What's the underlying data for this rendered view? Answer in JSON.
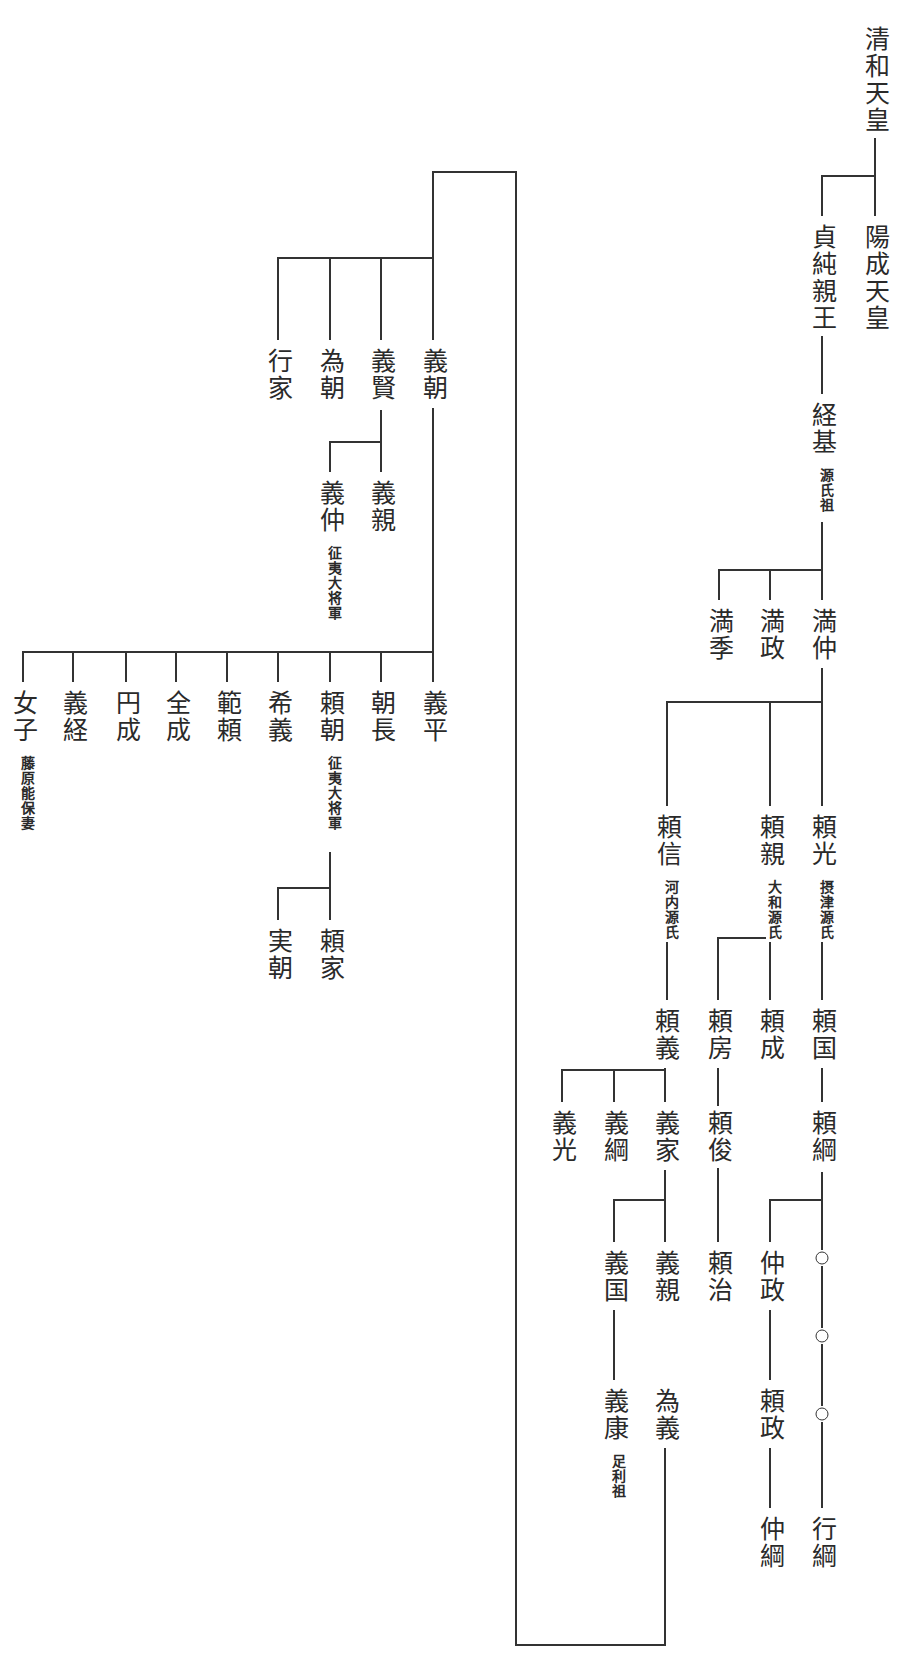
{
  "diagram": {
    "type": "genealogy-tree",
    "line_color": "#333333",
    "text_color": "#2a2a2a"
  },
  "nodes": [
    {
      "id": "seiwa",
      "name": "清和天皇",
      "x": 875,
      "y": 22
    },
    {
      "id": "yozei",
      "name": "陽成天皇",
      "x": 875,
      "y": 220
    },
    {
      "id": "sadazumi",
      "name": "貞純親王",
      "x": 822,
      "y": 220
    },
    {
      "id": "tsunemoto",
      "name": "経基",
      "x": 822,
      "y": 398,
      "note": "源氏祖"
    },
    {
      "id": "mitsunaka",
      "name": "満仲",
      "x": 822,
      "y": 604
    },
    {
      "id": "mitsumasa",
      "name": "満政",
      "x": 770,
      "y": 604
    },
    {
      "id": "mitsusue",
      "name": "満季",
      "x": 719,
      "y": 604
    },
    {
      "id": "yorimitsu",
      "name": "頼光",
      "x": 822,
      "y": 810,
      "note": "摂津源氏"
    },
    {
      "id": "yorichika",
      "name": "頼親",
      "x": 770,
      "y": 810,
      "note": "大和源氏"
    },
    {
      "id": "yorinobu",
      "name": "頼信",
      "x": 667,
      "y": 810,
      "note": "河内源氏"
    },
    {
      "id": "yorikuni",
      "name": "頼国",
      "x": 822,
      "y": 1004
    },
    {
      "id": "yorinari",
      "name": "頼成",
      "x": 770,
      "y": 1004
    },
    {
      "id": "yorifusa",
      "name": "頼房",
      "x": 718,
      "y": 1004
    },
    {
      "id": "yoriyoshi",
      "name": "頼義",
      "x": 665,
      "y": 1004
    },
    {
      "id": "yoritsuna",
      "name": "頼綱",
      "x": 822,
      "y": 1106
    },
    {
      "id": "yoritoshi",
      "name": "頼俊",
      "x": 718,
      "y": 1106
    },
    {
      "id": "yoshiie",
      "name": "義家",
      "x": 665,
      "y": 1106
    },
    {
      "id": "yoshitsuna",
      "name": "義綱",
      "x": 614,
      "y": 1106
    },
    {
      "id": "yoshimitsu",
      "name": "義光",
      "x": 562,
      "y": 1106
    },
    {
      "id": "nakamasa",
      "name": "仲政",
      "x": 770,
      "y": 1246
    },
    {
      "id": "yoriharu",
      "name": "頼治",
      "x": 718,
      "y": 1246
    },
    {
      "id": "yoshichika",
      "name": "義親",
      "x": 665,
      "y": 1246
    },
    {
      "id": "yoshikuni",
      "name": "義国",
      "x": 614,
      "y": 1246
    },
    {
      "id": "yorimasa",
      "name": "頼政",
      "x": 770,
      "y": 1384
    },
    {
      "id": "tameyoshi",
      "name": "為義",
      "x": 665,
      "y": 1384
    },
    {
      "id": "yoshiyasu",
      "name": "義康",
      "x": 614,
      "y": 1384,
      "note": "足利祖"
    },
    {
      "id": "nakatsuna",
      "name": "仲綱",
      "x": 770,
      "y": 1512
    },
    {
      "id": "yukitsuna",
      "name": "行綱",
      "x": 822,
      "y": 1512
    },
    {
      "id": "yoshitomo",
      "name": "義朝",
      "x": 433,
      "y": 344
    },
    {
      "id": "yoshikata",
      "name": "義賢",
      "x": 381,
      "y": 344
    },
    {
      "id": "tametomo",
      "name": "為朝",
      "x": 330,
      "y": 344
    },
    {
      "id": "yukiie",
      "name": "行家",
      "x": 278,
      "y": 344
    },
    {
      "id": "yoshichika2",
      "name": "義親",
      "x": 381,
      "y": 476
    },
    {
      "id": "yoshinaka",
      "name": "義仲",
      "x": 330,
      "y": 476,
      "note": "征夷大将軍"
    },
    {
      "id": "yoshihira",
      "name": "義平",
      "x": 433,
      "y": 686
    },
    {
      "id": "tomonaga",
      "name": "朝長",
      "x": 381,
      "y": 686
    },
    {
      "id": "yoritomo",
      "name": "頼朝",
      "x": 330,
      "y": 686,
      "note": "征夷大将軍"
    },
    {
      "id": "mareyoshi",
      "name": "希義",
      "x": 278,
      "y": 686
    },
    {
      "id": "noriyori",
      "name": "範頼",
      "x": 227,
      "y": 686
    },
    {
      "id": "zenjo",
      "name": "全成",
      "x": 176,
      "y": 686
    },
    {
      "id": "enjo",
      "name": "円成",
      "x": 126,
      "y": 686
    },
    {
      "id": "yoshitsune",
      "name": "義経",
      "x": 73,
      "y": 686
    },
    {
      "id": "nyoshi",
      "name": "女子",
      "x": 23,
      "y": 686,
      "note": "藤原能保妻"
    },
    {
      "id": "yoriie",
      "name": "頼家",
      "x": 330,
      "y": 924
    },
    {
      "id": "sanetomo",
      "name": "実朝",
      "x": 278,
      "y": 924
    }
  ],
  "placeholders": [
    {
      "id": "unknown1",
      "symbol": "○",
      "x": 822,
      "y": 1258
    },
    {
      "id": "unknown2",
      "symbol": "○",
      "x": 822,
      "y": 1336
    },
    {
      "id": "unknown3",
      "symbol": "○",
      "x": 822,
      "y": 1414
    }
  ],
  "connectors": [
    "M875 120 L875 216",
    "M875 176 L822 176 L822 216",
    "M822 330 L822 394",
    "M822 522 L822 600",
    "M822 570 L719 570 L719 600",
    "M770 570 L770 600",
    "M822 668 L822 806",
    "M822 702 L667 702 L667 806",
    "M770 702 L770 806",
    "M822 890 L822 1000",
    "M770 890 L770 1000",
    "M770 938 L718 938 L718 1000",
    "M667 890 L667 1000",
    "M822 1068 L822 1102",
    "M665 1068 L665 1102",
    "M665 1070 L562 1070 L562 1102",
    "M614 1070 L614 1102",
    "M718 1068 L718 1242",
    "M822 1172 L822 1250",
    "M822 1200 L770 1200 L770 1242",
    "M665 1170 L665 1242",
    "M665 1200 L614 1200 L614 1242",
    "M822 1266 L822 1328",
    "M822 1344 L822 1406",
    "M822 1422 L822 1508",
    "M770 1310 L770 1380",
    "M770 1448 L770 1508",
    "M614 1310 L614 1380",
    "M665 1448 L665 1645 L516 1645 L516 172 L433 172 L433 340",
    "M433 408 L433 652",
    "M433 258 L278 258 L278 340",
    "M381 258 L381 340",
    "M330 258 L330 340",
    "M381 410 L381 472",
    "M381 442 L330 442 L330 472",
    "M433 652 L23 652 L23 682",
    "M73 652 L73 682",
    "M126 652 L126 682",
    "M176 652 L176 682",
    "M227 652 L227 682",
    "M278 652 L278 682",
    "M330 652 L330 682",
    "M381 652 L381 682",
    "M433 652 L433 682",
    "M330 852 L330 920",
    "M330 888 L278 888 L278 920"
  ]
}
